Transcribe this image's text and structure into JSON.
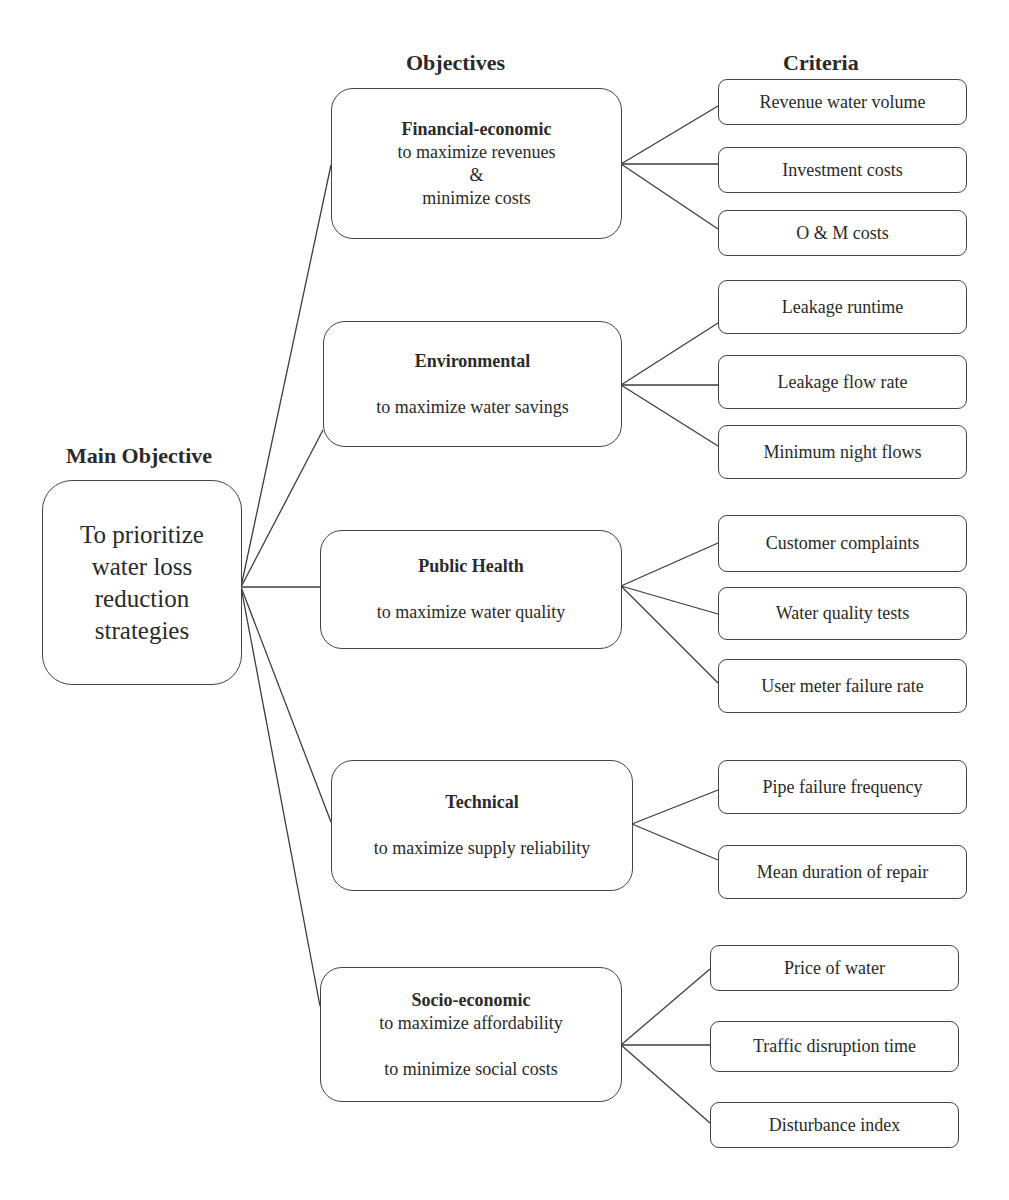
{
  "headings": {
    "objectives": "Objectives",
    "criteria": "Criteria",
    "main": "Main Objective"
  },
  "main_objective": {
    "lines": [
      "To prioritize",
      "water loss",
      "reduction",
      "strategies"
    ]
  },
  "objectives": [
    {
      "title": "Financial-economic",
      "lines": [
        "to maximize revenues",
        "&",
        "minimize costs"
      ],
      "criteria": [
        "Revenue water volume",
        "Investment costs",
        "O & M costs"
      ]
    },
    {
      "title": "Environmental",
      "lines": [
        "to maximize water savings"
      ],
      "criteria": [
        "Leakage runtime",
        "Leakage flow rate",
        "Minimum night flows"
      ]
    },
    {
      "title": "Public Health",
      "lines": [
        "to maximize water quality"
      ],
      "criteria": [
        "Customer complaints",
        "Water quality tests",
        "User meter failure rate"
      ]
    },
    {
      "title": "Technical",
      "lines": [
        "to maximize supply reliability"
      ],
      "criteria": [
        "Pipe failure frequency",
        "Mean duration of repair"
      ]
    },
    {
      "title": "Socio-economic",
      "lines": [
        "to maximize affordability",
        "to minimize social costs"
      ],
      "criteria": [
        "Price of water",
        "Traffic disruption time",
        "Disturbance index"
      ]
    }
  ]
}
